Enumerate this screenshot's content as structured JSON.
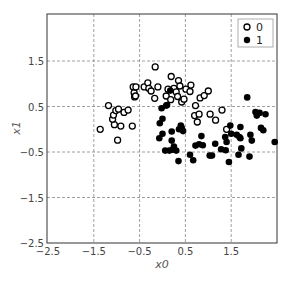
{
  "chart_data": {
    "type": "scatter",
    "title": "",
    "xlabel": "x0",
    "ylabel": "x1",
    "xlim": [
      -2.5,
      2.5
    ],
    "ylim": [
      -2.5,
      2.5
    ],
    "xticks": [
      -2.5,
      -1.5,
      -0.5,
      0.5,
      1.5
    ],
    "yticks": [
      -2.5,
      -1.5,
      -0.5,
      0.5,
      1.5
    ],
    "xtick_labels": [
      "−2.5",
      "−1.5",
      "−0.5",
      "0.5",
      "1.5"
    ],
    "ytick_labels": [
      "−2.5",
      "−1.5",
      "−0.5",
      "0.5",
      "1.5"
    ],
    "grid": true,
    "grid_style": "dashed",
    "legend_position": "upper right",
    "series": [
      {
        "name": "0",
        "marker": "hollow-circle",
        "color": "#000000",
        "points": [
          [
            -1.36,
            0.0
          ],
          [
            -1.18,
            0.52
          ],
          [
            -0.98,
            -0.24
          ],
          [
            -1.05,
            0.1
          ],
          [
            -1.09,
            0.22
          ],
          [
            -1.07,
            0.31
          ],
          [
            -1.02,
            0.41
          ],
          [
            -0.96,
            0.44
          ],
          [
            -0.91,
            0.07
          ],
          [
            -0.84,
            0.37
          ],
          [
            -0.75,
            0.42
          ],
          [
            -0.66,
            0.07
          ],
          [
            -0.64,
            0.93
          ],
          [
            -0.62,
            0.8
          ],
          [
            -0.61,
            0.71
          ],
          [
            -0.59,
            0.73
          ],
          [
            -0.58,
            0.93
          ],
          [
            -0.4,
            0.93
          ],
          [
            -0.32,
            1.02
          ],
          [
            -0.3,
            0.9
          ],
          [
            -0.25,
            0.84
          ],
          [
            -0.17,
            0.68
          ],
          [
            -0.16,
            1.37
          ],
          [
            -0.1,
            0.93
          ],
          [
            0.08,
            0.73
          ],
          [
            0.18,
            0.65
          ],
          [
            0.19,
            1.16
          ],
          [
            0.25,
            0.9
          ],
          [
            0.3,
            0.82
          ],
          [
            0.33,
            0.72
          ],
          [
            0.35,
            1.07
          ],
          [
            0.38,
            0.95
          ],
          [
            0.42,
            0.6
          ],
          [
            0.51,
            0.88
          ],
          [
            0.6,
            0.83
          ],
          [
            0.62,
            0.97
          ],
          [
            0.7,
            0.3
          ],
          [
            0.72,
            0.52
          ],
          [
            0.76,
            0.16
          ],
          [
            0.8,
            0.33
          ],
          [
            0.82,
            0.69
          ],
          [
            0.91,
            0.74
          ],
          [
            1.0,
            0.84
          ],
          [
            1.04,
            0.33
          ],
          [
            1.16,
            0.2
          ],
          [
            1.3,
            0.42
          ],
          [
            1.4,
            0.0
          ],
          [
            0.47,
            0.66
          ],
          [
            0.12,
            0.88
          ]
        ]
      },
      {
        "name": "1",
        "marker": "filled-circle",
        "color": "#000000",
        "points": [
          [
            -0.02,
            0.46
          ],
          [
            -0.06,
            0.13
          ],
          [
            0.0,
            0.23
          ],
          [
            -0.07,
            -0.2
          ],
          [
            0.0,
            -0.1
          ],
          [
            0.06,
            -0.47
          ],
          [
            0.08,
            0.52
          ],
          [
            0.1,
            0.53
          ],
          [
            0.15,
            -0.47
          ],
          [
            0.17,
            0.85
          ],
          [
            0.2,
            -0.05
          ],
          [
            0.2,
            -0.25
          ],
          [
            0.22,
            -0.45
          ],
          [
            0.25,
            -0.38
          ],
          [
            0.3,
            -0.47
          ],
          [
            0.35,
            -0.7
          ],
          [
            0.36,
            0.0
          ],
          [
            0.4,
            0.08
          ],
          [
            0.42,
            0.03
          ],
          [
            0.45,
            -0.04
          ],
          [
            0.6,
            -0.56
          ],
          [
            0.67,
            -0.68
          ],
          [
            0.72,
            -0.36
          ],
          [
            0.8,
            -0.33
          ],
          [
            0.85,
            -0.15
          ],
          [
            0.88,
            -0.35
          ],
          [
            1.03,
            -0.58
          ],
          [
            1.08,
            -0.58
          ],
          [
            1.15,
            -0.32
          ],
          [
            1.28,
            -0.44
          ],
          [
            1.37,
            -0.17
          ],
          [
            1.38,
            -0.46
          ],
          [
            1.4,
            -0.28
          ],
          [
            1.45,
            -0.72
          ],
          [
            1.48,
            0.08
          ],
          [
            1.5,
            -0.1
          ],
          [
            1.62,
            -0.12
          ],
          [
            1.66,
            -0.56
          ],
          [
            1.68,
            -0.17
          ],
          [
            1.7,
            0.05
          ],
          [
            1.72,
            -0.42
          ],
          [
            1.7,
            -0.2
          ],
          [
            1.85,
            0.7
          ],
          [
            1.9,
            -0.6
          ],
          [
            1.92,
            -0.12
          ],
          [
            1.95,
            -0.25
          ],
          [
            2.03,
            0.38
          ],
          [
            2.06,
            0.3
          ],
          [
            2.12,
            0.36
          ],
          [
            2.15,
            0.03
          ],
          [
            2.2,
            -0.02
          ],
          [
            2.25,
            0.33
          ],
          [
            2.45,
            -0.28
          ]
        ]
      }
    ]
  },
  "legend": {
    "items": [
      {
        "label": "0",
        "marker": "hollow-circle"
      },
      {
        "label": "1",
        "marker": "filled-circle"
      }
    ]
  },
  "axes": {
    "xlabel": "x0",
    "ylabel": "x1"
  }
}
